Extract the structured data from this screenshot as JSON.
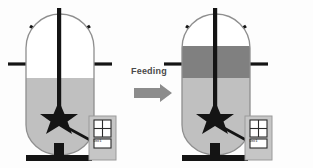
{
  "figure": {
    "background_color": "#fdfdfd"
  },
  "process_arrow": {
    "label": "Feeding",
    "label_color": "#4a4a4a",
    "arrow_color": "#8c8c8c",
    "arrow_direction": "right"
  },
  "colors": {
    "vessel_outline": "#8f8f8f",
    "broth_light_gray": "#c0c0c0",
    "feed_dark_gray": "#808080",
    "headspace_white": "#ffffff",
    "nozzle_black": "#141414",
    "shaft_black": "#141414",
    "impeller_black": "#141414",
    "panel_fill": "#c6c6c6",
    "panel_outline": "#9a9a9a",
    "panel_button_fill": "#ffffff"
  },
  "reactors": [
    {
      "id": "left",
      "name": "bioreactor-before-feeding",
      "state": "before",
      "liquid_layers": [
        {
          "name": "headspace",
          "color": "#ffffff",
          "fill_fraction": 0.45
        },
        {
          "name": "culture-broth",
          "color": "#c0c0c0",
          "fill_fraction": 0.55
        }
      ],
      "panel_text": "Unit 5",
      "nozzle_count": 4,
      "impeller": "star"
    },
    {
      "id": "right",
      "name": "bioreactor-after-feeding",
      "state": "after",
      "liquid_layers": [
        {
          "name": "headspace",
          "color": "#ffffff",
          "fill_fraction": 0.12
        },
        {
          "name": "feed-medium",
          "color": "#808080",
          "fill_fraction": 0.28
        },
        {
          "name": "culture-broth",
          "color": "#c0c0c0",
          "fill_fraction": 0.6
        }
      ],
      "panel_text": "Unit 5",
      "nozzle_count": 4,
      "impeller": "star"
    }
  ]
}
